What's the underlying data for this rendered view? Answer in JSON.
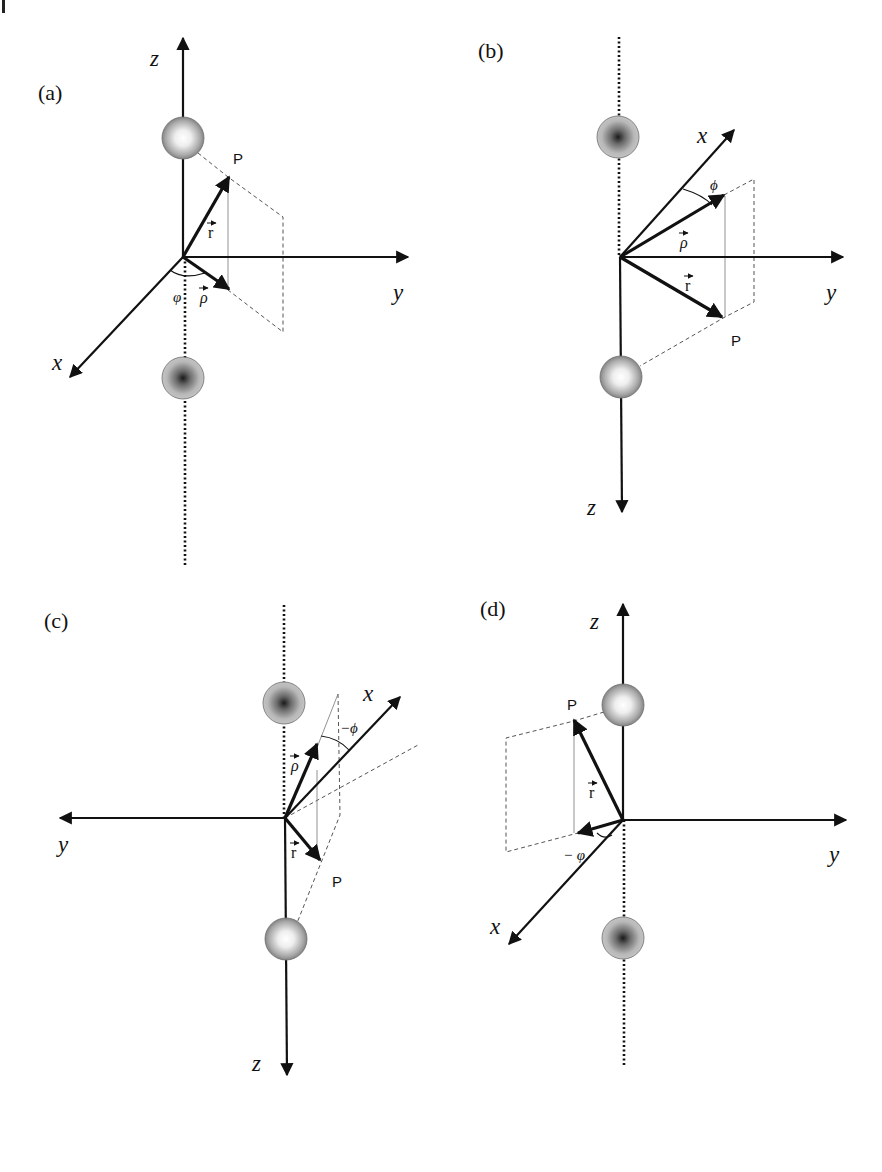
{
  "figure": {
    "colors": {
      "ink": "#111111",
      "dashed": "#555555",
      "thin": "#777777",
      "sphere_light_center": "#ffffff",
      "sphere_dark_center": "#1a1a1a",
      "sphere_edge": "#6f6f6f",
      "sphere_mid": "#b5b5b5"
    },
    "panels": [
      {
        "id": "a",
        "label": "(a)",
        "label_pos": [
          38,
          100
        ],
        "origin": [
          183,
          257
        ],
        "axes": {
          "z": {
            "label": "z",
            "tip": [
              183,
              38
            ],
            "label_pos": [
              150,
              66
            ],
            "solid_from": [
              183,
              257
            ]
          },
          "y": {
            "label": "y",
            "tip": [
              408,
              257
            ],
            "label_pos": [
              393,
              300
            ]
          },
          "x": {
            "label": "x",
            "tip": [
              70,
              377
            ],
            "label_pos": [
              52,
              370
            ]
          }
        },
        "dotted_line": [
          [
            185,
            257
          ],
          [
            185,
            566
          ]
        ],
        "spheres": [
          {
            "type": "light",
            "center": [
              183,
              138
            ],
            "r": 21
          },
          {
            "type": "dark",
            "center": [
              183,
              378
            ],
            "r": 21
          }
        ],
        "vectors": [
          {
            "name": "r",
            "tip": [
              229,
              177
            ],
            "label": "r",
            "label_pos": [
              208,
              238
            ]
          },
          {
            "name": "rho",
            "tip": [
              229,
              289
            ],
            "label": "ρ",
            "label_pos": [
              200,
              303
            ]
          }
        ],
        "point": {
          "label": "P",
          "pos": [
            233,
            164
          ]
        },
        "dashed": [
          [
            [
              198,
              153
            ],
            [
              228,
              177
            ],
            [
              283,
              217
            ],
            [
              283,
              332
            ],
            [
              228,
              290
            ]
          ]
        ],
        "thin": [
          [
            [
              228,
              177
            ],
            [
              228,
              290
            ]
          ]
        ],
        "angle": {
          "label": "φ",
          "pos": [
            173,
            302
          ],
          "arc": "M 170 270 Q 183 280 205 273"
        }
      },
      {
        "id": "b",
        "label": "(b)",
        "label_pos": [
          478,
          58
        ],
        "origin": [
          620,
          257
        ],
        "axes": {
          "z": {
            "label": "z",
            "tip": [
              622,
              512
            ],
            "label_pos": [
              587,
              515
            ],
            "solid_from": [
              620,
              257
            ]
          },
          "y": {
            "label": "y",
            "tip": [
              843,
              257
            ],
            "label_pos": [
              826,
              300
            ]
          },
          "x": {
            "label": "x",
            "tip": [
              734,
              130
            ],
            "label_pos": [
              697,
              143
            ]
          }
        },
        "dotted_line": [
          [
            619,
            37
          ],
          [
            619,
            257
          ]
        ],
        "spheres": [
          {
            "type": "dark",
            "center": [
              618,
              137
            ],
            "r": 21
          },
          {
            "type": "light",
            "center": [
              621,
              377
            ],
            "r": 21
          }
        ],
        "vectors": [
          {
            "name": "rho",
            "tip": [
              724,
              195
            ],
            "label": "ρ",
            "label_pos": [
              680,
              248
            ]
          },
          {
            "name": "r",
            "tip": [
              722,
              317
            ],
            "label": "r",
            "label_pos": [
              685,
              291
            ]
          }
        ],
        "point": {
          "label": "P",
          "pos": [
            731,
            346
          ]
        },
        "dashed": [
          [
            [
              724,
              195
            ],
            [
              754,
              179
            ],
            [
              754,
              302
            ],
            [
              725,
              317
            ],
            [
              640,
              366
            ]
          ]
        ],
        "thin": [
          [
            [
              725,
              196
            ],
            [
              725,
              317
            ]
          ]
        ],
        "angle": {
          "label": "ϕ",
          "pos": [
            710,
            190
          ],
          "arc": "M 683 189 Q 703 195 712 205"
        }
      },
      {
        "id": "c",
        "label": "(c)",
        "label_pos": [
          44,
          628
        ],
        "origin": [
          285,
          818
        ],
        "axes": {
          "z": {
            "label": "z",
            "tip": [
              287,
              1075
            ],
            "label_pos": [
              252,
              1071
            ],
            "solid_from": [
              285,
              818
            ]
          },
          "y": {
            "label": "y",
            "tip": [
              60,
              818
            ],
            "label_pos": [
              58,
              852
            ]
          },
          "x": {
            "label": "x",
            "tip": [
              400,
              697
            ],
            "label_pos": [
              363,
              701
            ]
          }
        },
        "dotted_line": [
          [
            284,
            605
          ],
          [
            284,
            818
          ]
        ],
        "spheres": [
          {
            "type": "dark",
            "center": [
              284,
              703
            ],
            "r": 21
          },
          {
            "type": "light",
            "center": [
              286,
              939
            ],
            "r": 21
          }
        ],
        "vectors": [
          {
            "name": "rho",
            "tip": [
              317,
              744
            ],
            "label": "ρ",
            "label_pos": [
              291,
              771
            ]
          },
          {
            "name": "r",
            "tip": [
              320,
              860
            ],
            "label": "r",
            "label_pos": [
              291,
              858
            ]
          }
        ],
        "point": {
          "label": "P",
          "pos": [
            332,
            887
          ]
        },
        "dashed": [
          [
            [
              338,
              694
            ],
            [
              340,
              815
            ],
            [
              297,
              923
            ]
          ],
          [
            [
              285,
              818
            ],
            [
              418,
              745
            ]
          ]
        ],
        "thin": [
          [
            [
              338,
              694
            ],
            [
              318,
              745
            ]
          ],
          [
            [
              317,
              770
            ],
            [
              317,
              858
            ]
          ]
        ],
        "angle": {
          "label": "−ϕ",
          "pos": [
            340,
            733
          ],
          "arc": "M 321 736 Q 338 738 349 750"
        }
      },
      {
        "id": "d",
        "label": "(d)",
        "label_pos": [
          480,
          616
        ],
        "origin": [
          623,
          820
        ],
        "axes": {
          "z": {
            "label": "z",
            "tip": [
              623,
              604
            ],
            "label_pos": [
              590,
              629
            ],
            "solid_from": [
              623,
              820
            ]
          },
          "y": {
            "label": "y",
            "tip": [
              846,
              820
            ],
            "label_pos": [
              829,
              862
            ]
          },
          "x": {
            "label": "x",
            "tip": [
              509,
              944
            ],
            "label_pos": [
              490,
              934
            ]
          }
        },
        "dotted_line": [
          [
            624,
            820
          ],
          [
            624,
            1067
          ]
        ],
        "spheres": [
          {
            "type": "light",
            "center": [
              623,
              705
            ],
            "r": 21
          },
          {
            "type": "dark",
            "center": [
              623,
              938
            ],
            "r": 21
          }
        ],
        "vectors": [
          {
            "name": "r",
            "tip": [
              574,
              720
            ],
            "label": "r",
            "label_pos": [
              589,
              798
            ]
          },
          {
            "name": "rho",
            "tip": [
              578,
              833
            ],
            "label": "",
            "label_pos": [
              0,
              0
            ]
          }
        ],
        "point": {
          "label": "P",
          "pos": [
            567,
            710
          ]
        },
        "dashed": [
          [
            [
              604,
              712
            ],
            [
              574,
              721
            ],
            [
              506,
              738
            ],
            [
              506,
              852
            ],
            [
              578,
              833
            ]
          ]
        ],
        "thin": [
          [
            [
              574,
              721
            ],
            [
              574,
              833
            ]
          ]
        ],
        "angle": {
          "label": "− φ",
          "pos": [
            563,
            860
          ],
          "arc": "M 597 833 Q 604 840 612 835"
        }
      }
    ]
  }
}
